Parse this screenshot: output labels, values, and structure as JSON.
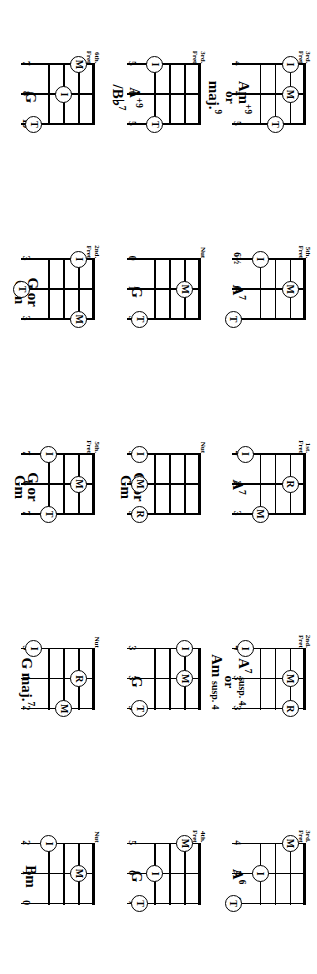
{
  "document": {
    "kind": "chord-chart-page",
    "instrument_strings": 3,
    "frets_shown": 4,
    "orientation": "rotated-90",
    "finger_legend": {
      "I": "index",
      "M": "middle",
      "R": "ring",
      "T": "thumb"
    },
    "fret_caption_nut": "Nut",
    "fret_caption_word": "Fret"
  },
  "columns": [
    {
      "id": "column-1",
      "chords": [
        {
          "name_lines": [
            "A<sup>6</sup>"
          ],
          "name_plain": "A6",
          "fret_caption": [
            "3rd.",
            "Fret"
          ],
          "fret_numbers": [
            "4",
            "5",
            "6½"
          ],
          "markers": [
            {
              "finger": "M",
              "string": 1,
              "fret": 1
            },
            {
              "finger": "I",
              "string": 2,
              "fret": 3
            },
            {
              "finger": "T",
              "string": 3,
              "fret": 5
            }
          ]
        },
        {
          "name_lines": [
            "G"
          ],
          "name_plain": "G",
          "fret_caption": [
            "4th.",
            "Fret"
          ],
          "fret_numbers": [
            "5",
            "6",
            "7"
          ],
          "markers": [
            {
              "finger": "M",
              "string": 1,
              "fret": 1
            },
            {
              "finger": "I",
              "string": 2,
              "fret": 3
            },
            {
              "finger": "T",
              "string": 3,
              "fret": 4
            }
          ]
        },
        {
          "name_lines": [
            "Bm"
          ],
          "name_plain": "Bm",
          "fret_caption": [
            "Nut",
            ""
          ],
          "fret_numbers": [
            "2",
            "1",
            "0"
          ],
          "markers": [
            {
              "finger": "I",
              "string": 1,
              "fret": 3
            },
            {
              "finger": "M",
              "string": 2,
              "fret": 1
            }
          ]
        }
      ]
    },
    {
      "id": "column-2",
      "chords": [
        {
          "name_lines": [
            "A<sup>7</sup> <span class=\"susp\">susp. 4</span>",
            "<span class=\"or\">or</span>",
            "Am <span class=\"susp\">susp. 4</span>"
          ],
          "name_plain": "A7 susp. 4 or Am susp. 4",
          "fret_caption": [
            "2nd.",
            "Fret"
          ],
          "fret_numbers": [
            "4",
            "3",
            "3"
          ],
          "markers": [
            {
              "finger": "I",
              "string": 1,
              "fret": 4
            },
            {
              "finger": "M",
              "string": 2,
              "fret": 1
            },
            {
              "finger": "R",
              "string": 3,
              "fret": 1
            }
          ]
        },
        {
          "name_lines": [
            "G"
          ],
          "name_plain": "G",
          "fret_caption": [
            "",
            ""
          ],
          "fret_numbers": [
            "3",
            "3",
            "5"
          ],
          "markers": [
            {
              "finger": "I",
              "string": 1,
              "fret": 1
            },
            {
              "finger": "M",
              "string": 2,
              "fret": 1
            },
            {
              "finger": "T",
              "string": 3,
              "fret": 4
            }
          ]
        },
        {
          "name_lines": [
            "G maj.<sup>7</sup>"
          ],
          "name_plain": "G maj.7",
          "fret_caption": [
            "Nut",
            ""
          ],
          "fret_numbers": [
            "3",
            "1",
            "2"
          ],
          "markers": [
            {
              "finger": "I",
              "string": 1,
              "fret": 4
            },
            {
              "finger": "R",
              "string": 2,
              "fret": 1
            },
            {
              "finger": "M",
              "string": 3,
              "fret": 2
            }
          ]
        }
      ]
    },
    {
      "id": "column-3",
      "chords": [
        {
          "name_lines": [
            "A<sup>7</sup>"
          ],
          "name_plain": "A7",
          "fret_caption": [
            "1st.",
            "Fret"
          ],
          "fret_numbers": [
            "4",
            "2",
            "3"
          ],
          "markers": [
            {
              "finger": "I",
              "string": 1,
              "fret": 4
            },
            {
              "finger": "R",
              "string": 2,
              "fret": 1
            },
            {
              "finger": "M",
              "string": 3,
              "fret": 3
            }
          ]
        },
        {
          "name_lines": [
            "G or",
            "Gm"
          ],
          "name_plain": "G or Gm",
          "fret_caption": [
            "Nut",
            ""
          ],
          "fret_numbers": [
            "3",
            "3",
            "3"
          ],
          "markers": [
            {
              "finger": "I",
              "string": 1,
              "fret": 4
            },
            {
              "finger": "M",
              "string": 2,
              "fret": 4
            },
            {
              "finger": "R",
              "string": 3,
              "fret": 4
            }
          ]
        },
        {
          "name_lines": [
            "G or",
            "Gm"
          ],
          "name_plain": "G or Gm",
          "fret_caption": [
            "5th.",
            "Fret"
          ],
          "fret_numbers": [
            "7",
            "6",
            "7"
          ],
          "markers": [
            {
              "finger": "I",
              "string": 1,
              "fret": 3
            },
            {
              "finger": "M",
              "string": 2,
              "fret": 1
            },
            {
              "finger": "T",
              "string": 3,
              "fret": 3
            }
          ]
        }
      ]
    },
    {
      "id": "column-4",
      "chords": [
        {
          "name_lines": [
            "A<sup>7</sup>"
          ],
          "name_plain": "A7",
          "fret_caption": [
            "5th.",
            "Fret"
          ],
          "fret_numbers": [
            "6½",
            "6",
            "8"
          ],
          "markers": [
            {
              "finger": "I",
              "string": 1,
              "fret": 3
            },
            {
              "finger": "M",
              "string": 2,
              "fret": 1
            },
            {
              "finger": "T",
              "string": 3,
              "fret": 5
            }
          ]
        },
        {
          "name_lines": [
            "G"
          ],
          "name_plain": "G",
          "fret_caption": [
            "Nut",
            ""
          ],
          "fret_numbers": [
            "0",
            "1",
            "3"
          ],
          "markers": [
            {
              "finger": "M",
              "string": 2,
              "fret": 1
            },
            {
              "finger": "T",
              "string": 3,
              "fret": 4
            }
          ]
        },
        {
          "name_lines": [
            "G or",
            "Gm"
          ],
          "name_plain": "G or Gm",
          "fret_caption": [
            "2nd.",
            "Fret"
          ],
          "fret_numbers": [
            "3",
            "6",
            "3"
          ],
          "markers": [
            {
              "finger": "I",
              "string": 1,
              "fret": 1
            },
            {
              "finger": "T",
              "string": 2,
              "fret": 5
            },
            {
              "finger": "M",
              "string": 3,
              "fret": 1
            }
          ]
        }
      ]
    },
    {
      "id": "column-5",
      "chords": [
        {
          "name_lines": [
            "Am<sup>+9</sup>",
            "<span class=\"or\">or</span>",
            "maj.<sup>9</sup>"
          ],
          "name_plain": "Am+9 or maj.9",
          "fret_caption": [
            "3rd.",
            "Fret"
          ],
          "fret_numbers": [
            "4",
            "4",
            "5"
          ],
          "markers": [
            {
              "finger": "I",
              "string": 1,
              "fret": 1
            },
            {
              "finger": "M",
              "string": 2,
              "fret": 1
            },
            {
              "finger": "T",
              "string": 3,
              "fret": 2
            }
          ]
        },
        {
          "name_lines": [
            "A<sup>+9</sup>",
            "/B♭<sup>7</sup>"
          ],
          "name_plain": "A+9 / Bb7",
          "fret_caption": [
            "3rd.",
            "Fret"
          ],
          "fret_numbers": [
            "5",
            "0",
            "5"
          ],
          "markers": [
            {
              "finger": "I",
              "string": 1,
              "fret": 3
            },
            {
              "finger": "T",
              "string": 3,
              "fret": 3
            }
          ]
        },
        {
          "name_lines": [
            "G"
          ],
          "name_plain": "G",
          "fret_caption": [
            "6th.",
            "Fret"
          ],
          "fret_numbers": [
            "7",
            "8",
            "10"
          ],
          "markers": [
            {
              "finger": "M",
              "string": 1,
              "fret": 1
            },
            {
              "finger": "I",
              "string": 2,
              "fret": 2
            },
            {
              "finger": "T",
              "string": 3,
              "fret": 4
            }
          ]
        }
      ]
    }
  ]
}
